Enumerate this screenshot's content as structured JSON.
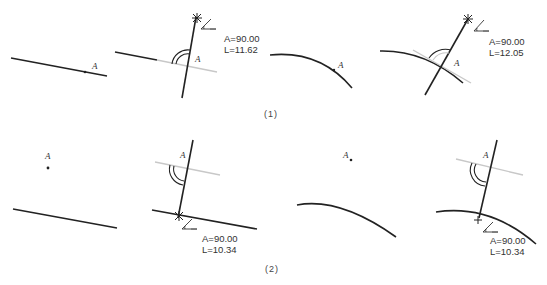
{
  "figure": {
    "captions": {
      "row1": "(1)",
      "row2": "(2)"
    },
    "point_label": "A",
    "colors": {
      "line": "#222222",
      "construction": "#c8c8c8",
      "text": "#333333"
    },
    "row1": {
      "panels": [
        {
          "id": "1a",
          "description": "straight line with point A on it"
        },
        {
          "id": "1b",
          "description": "perpendicular drawn through A on straight line",
          "measure": {
            "angle": "A=90.00",
            "length": "L=11.62"
          }
        },
        {
          "id": "1c",
          "description": "curve with point A on it"
        },
        {
          "id": "1d",
          "description": "perpendicular drawn through A on curve (tangent shown)",
          "measure": {
            "angle": "A=90.00",
            "length": "L=12.05"
          }
        }
      ]
    },
    "row2": {
      "panels": [
        {
          "id": "2a",
          "description": "point A off a straight line"
        },
        {
          "id": "2b",
          "description": "perpendicular dropped from A to straight line",
          "measure": {
            "angle": "A=90.00",
            "length": "L=10.34"
          }
        },
        {
          "id": "2c",
          "description": "point A off a curve"
        },
        {
          "id": "2d",
          "description": "perpendicular dropped from A to curve",
          "measure": {
            "angle": "A=90.00",
            "length": "L=10.34"
          }
        }
      ]
    }
  }
}
